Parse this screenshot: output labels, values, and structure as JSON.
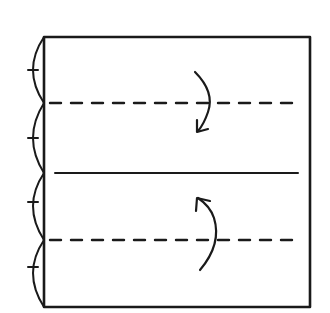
{
  "diagram": {
    "type": "origami-fold-instruction",
    "colors": {
      "stroke": "#1a1a1a",
      "background": "#ffffff"
    },
    "square": {
      "x": 44,
      "y": 37,
      "width": 266,
      "height": 270
    },
    "lines": [
      {
        "id": "top-valley-fold",
        "style": "dashed",
        "y": 103,
        "x1": 50,
        "x2": 302
      },
      {
        "id": "center-crease",
        "style": "solid",
        "y": 173,
        "x1": 55,
        "x2": 298
      },
      {
        "id": "bottom-valley-fold",
        "style": "dashed",
        "y": 240,
        "x1": 50,
        "x2": 298
      }
    ],
    "division_marks": {
      "count": 4,
      "label": "equal-quarters",
      "boundaries_y": [
        37,
        103,
        173,
        240,
        307
      ]
    },
    "arrows": [
      {
        "id": "fold-top-down",
        "direction": "down",
        "label": "fold top edge down to center"
      },
      {
        "id": "fold-bottom-up",
        "direction": "up",
        "label": "fold bottom edge up to center"
      }
    ]
  }
}
